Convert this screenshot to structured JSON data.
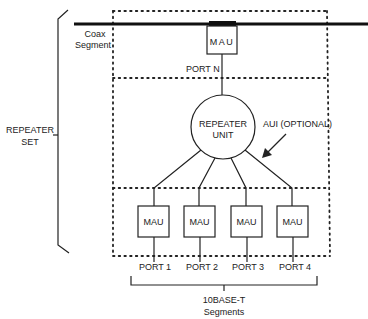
{
  "diagram": {
    "colors": {
      "line": "#222222",
      "coax": "#111111",
      "background": "#ffffff"
    },
    "repeater_set_label": [
      "REPEATER",
      "SET"
    ],
    "coax_label": [
      "Coax",
      "Segment"
    ],
    "coax_mau": {
      "label": "MAU",
      "port": "PORT N"
    },
    "repeater_unit": [
      "REPEATER",
      "UNIT"
    ],
    "aui_label": "AUI (OPTIONAL)",
    "port_maus": [
      {
        "label": "MAU",
        "port": "PORT 1"
      },
      {
        "label": "MAU",
        "port": "PORT 2"
      },
      {
        "label": "MAU",
        "port": "PORT 3"
      },
      {
        "label": "MAU",
        "port": "PORT 4"
      }
    ],
    "segments_label": [
      "10BASE-T",
      "Segments"
    ]
  }
}
